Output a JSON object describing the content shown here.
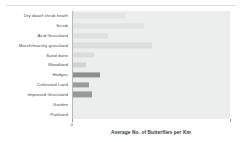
{
  "chart_data": {
    "type": "bar",
    "orientation": "horizontal",
    "title": "",
    "xlabel": "Average No. of Butterflies per Km",
    "ylabel": "",
    "xlim": [
      0,
      100
    ],
    "grid": false,
    "legend": null,
    "categories": [
      "Dry dwarf shrub heath",
      "Scrub",
      "Acid Grassland",
      "Marsh/marshy grassland",
      "Sand dune",
      "Woodland",
      "Hedges",
      "Cultivated Land",
      "Improved Grassland",
      "Garden",
      "Parkland"
    ],
    "values": [
      33,
      45,
      22,
      50,
      13,
      8,
      17,
      10,
      12,
      0,
      0
    ],
    "bar_colors": [
      "#e3e4e4",
      "#e0e1e1",
      "#dedfdf",
      "#dcdddd",
      "#dadbdb",
      "#d2d3d3",
      "#8d8e8e",
      "#9a9b9b",
      "#989999",
      "#eceded",
      "#eceded"
    ],
    "ticks": [
      {
        "label": "0",
        "value": 0
      },
      {
        "label": "",
        "value": 100
      }
    ],
    "panel_color": "#eceded",
    "axis_color": "#b9b9b9"
  }
}
